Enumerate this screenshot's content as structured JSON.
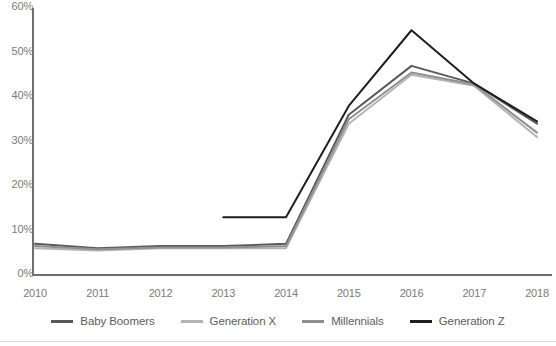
{
  "chart_data": {
    "type": "line",
    "title": "",
    "xlabel": "",
    "ylabel": "",
    "x": [
      "2010",
      "2011",
      "2012",
      "2013",
      "2014",
      "2015",
      "2016",
      "2017",
      "2018"
    ],
    "ylim": [
      0,
      60
    ],
    "ytick_labels": [
      "0%",
      "10%",
      "20%",
      "30%",
      "40%",
      "50%",
      "60%"
    ],
    "ytick_values": [
      0,
      10,
      20,
      30,
      40,
      50,
      60
    ],
    "grid": false,
    "legend_position": "bottom",
    "series": [
      {
        "name": "Baby Boomers",
        "color": "#595959",
        "values": [
          7,
          6,
          6.5,
          6.5,
          7,
          36,
          47,
          43,
          34
        ]
      },
      {
        "name": "Generation X",
        "color": "#b4b4b4",
        "values": [
          6,
          5.5,
          6,
          6,
          6,
          34,
          45,
          42.5,
          31
        ]
      },
      {
        "name": "Millennials",
        "color": "#8f8f8f",
        "values": [
          6.5,
          5.8,
          6.2,
          6.2,
          6.5,
          35,
          45.5,
          42.8,
          32
        ]
      },
      {
        "name": "Generation Z",
        "color": "#1f1f1f",
        "values": [
          null,
          null,
          null,
          13,
          13,
          38,
          55,
          43,
          34.5
        ]
      }
    ]
  },
  "axis": {
    "y_labels": [
      "60%",
      "50%",
      "40%",
      "30%",
      "20%",
      "10%",
      "0%"
    ],
    "x_labels": [
      "2010",
      "2011",
      "2012",
      "2013",
      "2014",
      "2015",
      "2016",
      "2017",
      "2018"
    ]
  },
  "legend": {
    "items": [
      {
        "label": "Baby Boomers",
        "color": "#595959"
      },
      {
        "label": "Generation X",
        "color": "#b4b4b4"
      },
      {
        "label": "Millennials",
        "color": "#8f8f8f"
      },
      {
        "label": "Generation Z",
        "color": "#1f1f1f"
      }
    ]
  }
}
